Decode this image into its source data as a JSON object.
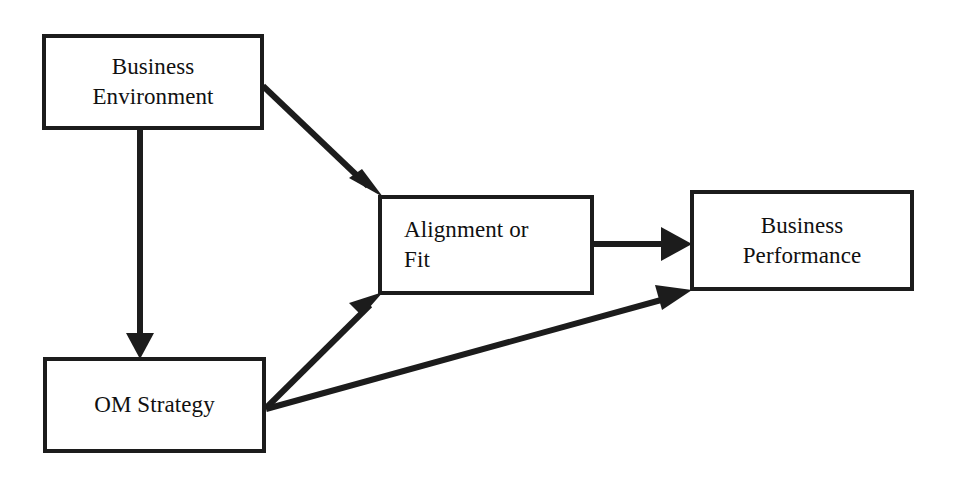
{
  "diagram": {
    "stroke_color": "#1c1c1c",
    "text_color": "#101010",
    "background_color": "#ffffff",
    "nodes": [
      {
        "id": "business-environment",
        "lines": [
          "Business",
          "Environment"
        ],
        "align": "center"
      },
      {
        "id": "alignment-or-fit",
        "lines": [
          "Alignment or",
          "Fit"
        ],
        "align": "left"
      },
      {
        "id": "business-performance",
        "lines": [
          "Business",
          "Performance"
        ],
        "align": "center"
      },
      {
        "id": "om-strategy",
        "lines": [
          "OM Strategy"
        ],
        "align": "center"
      }
    ],
    "edges": [
      {
        "id": "edge-business-environment-to-alignment",
        "from": "business-environment",
        "to": "alignment-or-fit",
        "style": "diagonal-down-right",
        "arrowhead": true
      },
      {
        "id": "edge-business-environment-to-om-strategy",
        "from": "business-environment",
        "to": "om-strategy",
        "style": "vertical-down",
        "arrowhead": true
      },
      {
        "id": "edge-om-strategy-to-alignment",
        "from": "om-strategy",
        "to": "alignment-or-fit",
        "style": "diagonal-up-right",
        "arrowhead": true
      },
      {
        "id": "edge-om-strategy-to-business-performance",
        "from": "om-strategy",
        "to": "business-performance",
        "style": "diagonal-up-right",
        "arrowhead": true
      },
      {
        "id": "edge-alignment-to-business-performance",
        "from": "alignment-or-fit",
        "to": "business-performance",
        "style": "horizontal-right",
        "arrowhead": true
      }
    ]
  }
}
